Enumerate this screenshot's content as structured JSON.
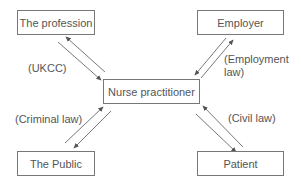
{
  "diagram": {
    "center": {
      "label": "Nurse practitioner"
    },
    "nodes": [
      {
        "id": "profession",
        "label": "The profession",
        "relation": "(UKCC)"
      },
      {
        "id": "employer",
        "label": "Employer",
        "relation_line1": "(Employment",
        "relation_line2": "law)"
      },
      {
        "id": "public",
        "label": "The Public",
        "relation": "(Criminal law)"
      },
      {
        "id": "patient",
        "label": "Patient",
        "relation": "(Civil law)"
      }
    ]
  }
}
